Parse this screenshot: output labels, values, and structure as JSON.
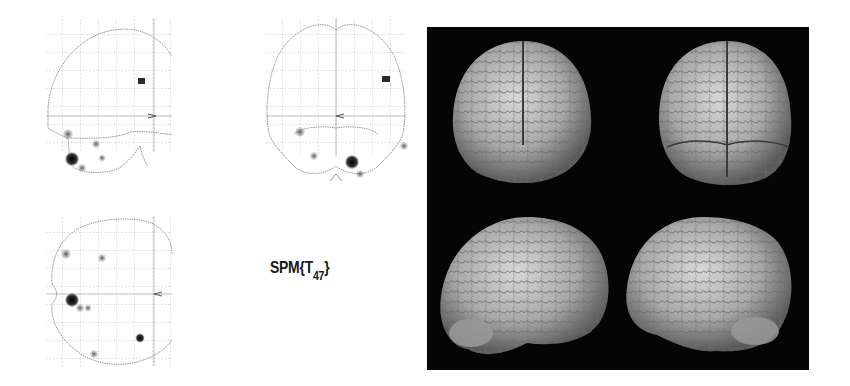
{
  "figure": {
    "glass_brain": {
      "views": [
        {
          "name": "sagittal",
          "x": 48,
          "y": 20,
          "w": 122,
          "h": 145
        },
        {
          "name": "coronal",
          "x": 266,
          "y": 20,
          "w": 138,
          "h": 150
        },
        {
          "name": "axial",
          "x": 48,
          "y": 217,
          "w": 122,
          "h": 150
        }
      ],
      "grid_color": "#b9b9b9",
      "outline_color": "#8a8a8a",
      "blob_color": "#1c1c1c"
    },
    "statistic_label": {
      "prefix": "SPM{T",
      "subscript": "47",
      "suffix": "}"
    },
    "render_panel": {
      "background": "#050505",
      "views": [
        "anterior",
        "posterior",
        "right-lateral",
        "left-lateral"
      ],
      "brain_color": "#b8b8b8"
    }
  }
}
